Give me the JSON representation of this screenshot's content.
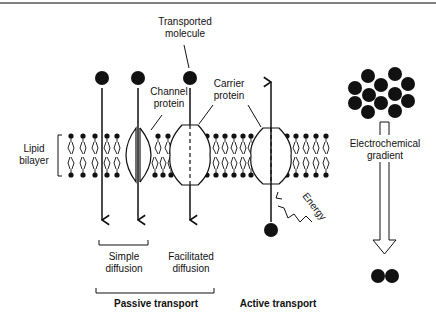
{
  "diagram": {
    "labels": {
      "transported_molecule": [
        "Transported",
        "molecule"
      ],
      "channel_protein": [
        "Channel",
        "protein"
      ],
      "carrier_protein": [
        "Carrier",
        "protein"
      ],
      "lipid_bilayer": [
        "Lipid",
        "bilayer"
      ],
      "electrochemical_gradient": [
        "Electrochemical",
        "gradient"
      ],
      "energy": "Energy",
      "simple_diffusion": [
        "Simple",
        "diffusion"
      ],
      "facilitated_diffusion": [
        "Facilitated",
        "diffusion"
      ],
      "passive_transport": "Passive transport",
      "active_transport": "Active transport"
    },
    "colors": {
      "ink": "#111111",
      "background": "#ffffff",
      "rule": "#555555"
    },
    "molecule_cluster_count": 12,
    "molecules_after_gradient": 2
  }
}
